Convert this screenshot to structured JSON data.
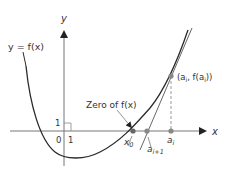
{
  "diagram": {
    "axes": {
      "x_label": "x",
      "y_label": "y",
      "tick_x_label": "1",
      "tick_y_label": "1",
      "origin_label": "0"
    },
    "curve_label": "y = f(x)",
    "zero_label": "Zero of f(x)",
    "points": {
      "x0": "x",
      "x0_sub": "0",
      "a_i1": "a",
      "a_i1_sub": "i+1",
      "a_i": "a",
      "a_i_sub": "i",
      "point_label_open": "(a",
      "point_label_sub": "i",
      "point_label_mid": ", f(a",
      "point_label_sub2": "i",
      "point_label_close": "))"
    },
    "colors": {
      "curve": "#2a2a2a",
      "axis": "#777777",
      "tangent": "#555555",
      "point": "#777777",
      "dashed": "#999999"
    }
  }
}
